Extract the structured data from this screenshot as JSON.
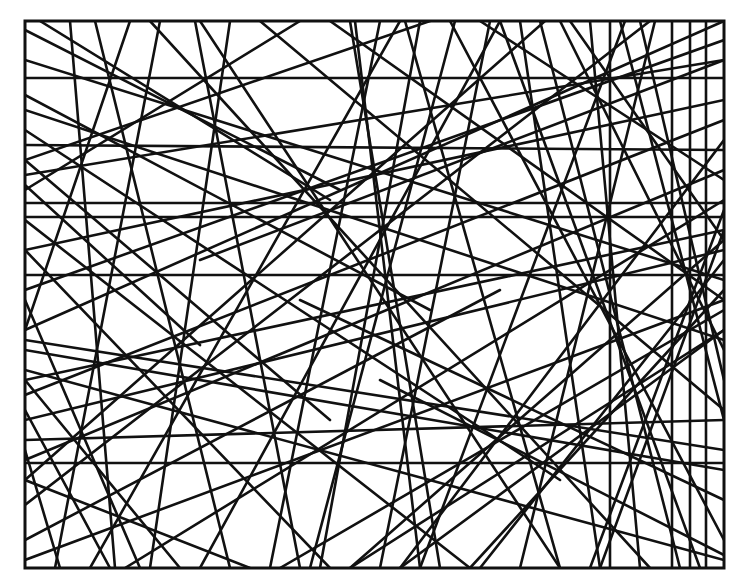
{
  "figure": {
    "frame": {
      "x": 25,
      "y": 21,
      "width": 699,
      "height": 547
    },
    "stroke_color": "#111111",
    "background_color": "#ffffff",
    "line_width": 2.6,
    "lines": [
      [
        25,
        78,
        724,
        78
      ],
      [
        25,
        203,
        724,
        203
      ],
      [
        25,
        217,
        724,
        217
      ],
      [
        25,
        275,
        724,
        275
      ],
      [
        25,
        463,
        724,
        463
      ],
      [
        672,
        21,
        672,
        568
      ],
      [
        706,
        21,
        706,
        568
      ],
      [
        25,
        30,
        340,
        190
      ],
      [
        40,
        21,
        330,
        200
      ],
      [
        25,
        60,
        724,
        280
      ],
      [
        25,
        95,
        430,
        310
      ],
      [
        25,
        130,
        560,
        480
      ],
      [
        25,
        160,
        330,
        420
      ],
      [
        25,
        185,
        200,
        345
      ],
      [
        25,
        220,
        470,
        568
      ],
      [
        25,
        250,
        330,
        568
      ],
      [
        25,
        300,
        140,
        568
      ],
      [
        25,
        330,
        724,
        21
      ],
      [
        25,
        395,
        724,
        120
      ],
      [
        25,
        420,
        724,
        250
      ],
      [
        25,
        505,
        650,
        21
      ],
      [
        25,
        540,
        500,
        290
      ],
      [
        25,
        410,
        110,
        568
      ],
      [
        25,
        480,
        250,
        568
      ],
      [
        70,
        21,
        115,
        568
      ],
      [
        95,
        21,
        230,
        568
      ],
      [
        130,
        21,
        25,
        330
      ],
      [
        160,
        21,
        55,
        568
      ],
      [
        195,
        21,
        300,
        568
      ],
      [
        230,
        21,
        150,
        568
      ],
      [
        260,
        21,
        724,
        410
      ],
      [
        300,
        21,
        25,
        190
      ],
      [
        330,
        21,
        724,
        300
      ],
      [
        355,
        21,
        420,
        568
      ],
      [
        380,
        21,
        270,
        568
      ],
      [
        405,
        21,
        560,
        568
      ],
      [
        430,
        21,
        25,
        160
      ],
      [
        455,
        21,
        310,
        568
      ],
      [
        480,
        21,
        724,
        180
      ],
      [
        490,
        21,
        380,
        568
      ],
      [
        500,
        21,
        700,
        568
      ],
      [
        520,
        21,
        600,
        568
      ],
      [
        545,
        21,
        25,
        480
      ],
      [
        570,
        21,
        724,
        240
      ],
      [
        590,
        21,
        640,
        568
      ],
      [
        610,
        21,
        610,
        568
      ],
      [
        625,
        21,
        420,
        568
      ],
      [
        640,
        21,
        724,
        380
      ],
      [
        655,
        21,
        520,
        568
      ],
      [
        690,
        21,
        690,
        568
      ],
      [
        724,
        40,
        25,
        290
      ],
      [
        724,
        60,
        200,
        260
      ],
      [
        724,
        100,
        25,
        250
      ],
      [
        724,
        140,
        400,
        568
      ],
      [
        724,
        170,
        25,
        460
      ],
      [
        724,
        210,
        590,
        568
      ],
      [
        724,
        230,
        25,
        380
      ],
      [
        724,
        260,
        480,
        568
      ],
      [
        724,
        300,
        25,
        560
      ],
      [
        724,
        330,
        350,
        568
      ],
      [
        724,
        350,
        560,
        21
      ],
      [
        724,
        420,
        620,
        21
      ],
      [
        724,
        450,
        25,
        340
      ],
      [
        724,
        500,
        300,
        300
      ],
      [
        724,
        540,
        450,
        21
      ],
      [
        724,
        555,
        380,
        380
      ],
      [
        680,
        568,
        540,
        21
      ],
      [
        650,
        568,
        150,
        21
      ],
      [
        600,
        568,
        724,
        230
      ],
      [
        560,
        568,
        200,
        21
      ],
      [
        470,
        568,
        724,
        290
      ],
      [
        440,
        568,
        350,
        21
      ],
      [
        400,
        568,
        724,
        330
      ],
      [
        350,
        568,
        724,
        240
      ],
      [
        320,
        568,
        420,
        21
      ],
      [
        280,
        568,
        724,
        310
      ],
      [
        200,
        568,
        500,
        21
      ],
      [
        180,
        568,
        25,
        380
      ],
      [
        125,
        568,
        724,
        200
      ],
      [
        90,
        568,
        400,
        21
      ],
      [
        60,
        568,
        25,
        450
      ],
      [
        25,
        350,
        724,
        470
      ],
      [
        25,
        370,
        724,
        560
      ],
      [
        25,
        440,
        724,
        420
      ],
      [
        25,
        110,
        724,
        340
      ],
      [
        25,
        145,
        724,
        150
      ],
      [
        25,
        175,
        724,
        60
      ]
    ]
  }
}
